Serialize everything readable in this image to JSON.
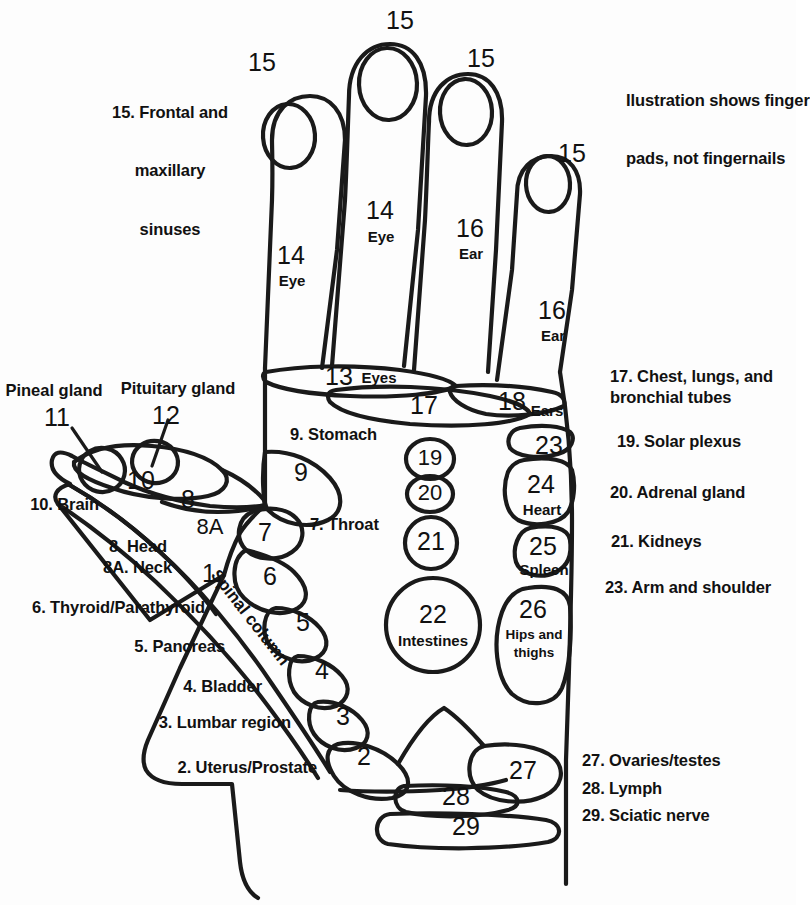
{
  "note": {
    "line1": "Ilustration shows finger",
    "line2": "pads, not fingernails"
  },
  "colors": {
    "background": "#fdfdfd",
    "ink": "#111111",
    "outline": "#1a1a1a"
  },
  "finger_labels": [
    {
      "id": "index",
      "top_number": "15",
      "zone_number": "14",
      "zone_name": "Eye"
    },
    {
      "id": "middle",
      "top_number": "15",
      "zone_number": "14",
      "zone_name": "Eye"
    },
    {
      "id": "ring",
      "top_number": "15",
      "zone_number": "16",
      "zone_name": "Ear"
    },
    {
      "id": "pinky",
      "top_number": "15",
      "zone_number": "16",
      "zone_name": "Ear"
    }
  ],
  "palm_zones": [
    {
      "num": "13",
      "name": "Eyes"
    },
    {
      "num": "17",
      "name": ""
    },
    {
      "num": "18",
      "name": "Ears"
    },
    {
      "num": "23",
      "name": ""
    },
    {
      "num": "24",
      "name": "Heart"
    },
    {
      "num": "25",
      "name": "Spleen"
    },
    {
      "num": "26",
      "name": "Hips and thighs"
    },
    {
      "num": "19",
      "name": ""
    },
    {
      "num": "20",
      "name": ""
    },
    {
      "num": "21",
      "name": ""
    },
    {
      "num": "22",
      "name": "Intestines"
    },
    {
      "num": "9",
      "name": ""
    },
    {
      "num": "7",
      "name": ""
    },
    {
      "num": "6",
      "name": ""
    },
    {
      "num": "5",
      "name": ""
    },
    {
      "num": "4",
      "name": ""
    },
    {
      "num": "3",
      "name": ""
    },
    {
      "num": "2",
      "name": ""
    },
    {
      "num": "1",
      "name": "Spinal column"
    },
    {
      "num": "8",
      "name": ""
    },
    {
      "num": "8A",
      "name": ""
    },
    {
      "num": "10",
      "name": ""
    },
    {
      "num": "27",
      "name": ""
    },
    {
      "num": "28",
      "name": ""
    },
    {
      "num": "29",
      "name": ""
    }
  ],
  "zone_numbers": {
    "n1": "1",
    "n2": "2",
    "n3": "3",
    "n4": "4",
    "n5": "5",
    "n6": "6",
    "n7": "7",
    "n8": "8",
    "n8a": "8A",
    "n9": "9",
    "n10": "10",
    "n11": "11",
    "n12": "12",
    "n13": "13",
    "n17": "17",
    "n18": "18",
    "n19": "19",
    "n20": "20",
    "n21": "21",
    "n22": "22",
    "n23": "23",
    "n24": "24",
    "n25": "25",
    "n26": "26",
    "n27": "27",
    "n28": "28",
    "n29": "29"
  },
  "zone_names": {
    "spinal_column": "Spinal column",
    "eyes13": "Eyes",
    "ears18": "Ears",
    "heart": "Heart",
    "spleen": "Spleen",
    "hips_l1": "Hips and",
    "hips_l2": "thighs",
    "intestines": "Intestines"
  },
  "callouts": {
    "pineal": "Pineal gland",
    "pituitary": "Pituitary gland"
  },
  "legend_left": [
    {
      "text": "15. Frontal and"
    },
    {
      "text": "maxillary"
    },
    {
      "text": "sinuses"
    }
  ],
  "legend_left_block": {
    "line1": "15. Frontal and",
    "line2": "maxillary",
    "line3": "sinuses"
  },
  "legend_thumb": [
    {
      "id": "brain",
      "text": "10. Brain"
    },
    {
      "id": "head",
      "text": "8. Head"
    },
    {
      "id": "neck",
      "text": "8A. Neck"
    },
    {
      "id": "thyroid",
      "text": "6. Thyroid/Parathyroid"
    },
    {
      "id": "pancreas",
      "text": "5. Pancreas"
    },
    {
      "id": "bladder",
      "text": "4. Bladder"
    },
    {
      "id": "lumbar",
      "text": "3. Lumbar region"
    },
    {
      "id": "uterus",
      "text": "2. Uterus/Prostate"
    }
  ],
  "legend_inline": [
    {
      "id": "stomach",
      "text": "9. Stomach"
    },
    {
      "id": "throat",
      "text": "7. Throat"
    }
  ],
  "legend_right": [
    {
      "id": "chest-l1",
      "text": "17. Chest, lungs, and"
    },
    {
      "id": "chest-l2",
      "text": "bronchial tubes"
    },
    {
      "id": "solar",
      "text": "19. Solar plexus"
    },
    {
      "id": "adrenal",
      "text": "20. Adrenal gland"
    },
    {
      "id": "kidneys",
      "text": "21. Kidneys"
    },
    {
      "id": "arm",
      "text": "23. Arm and shoulder"
    }
  ],
  "legend_bottom_right": [
    {
      "id": "ovaries",
      "text": "27. Ovaries/testes"
    },
    {
      "id": "lymph",
      "text": "28. Lymph"
    },
    {
      "id": "sciatic",
      "text": "29. Sciatic nerve"
    }
  ]
}
